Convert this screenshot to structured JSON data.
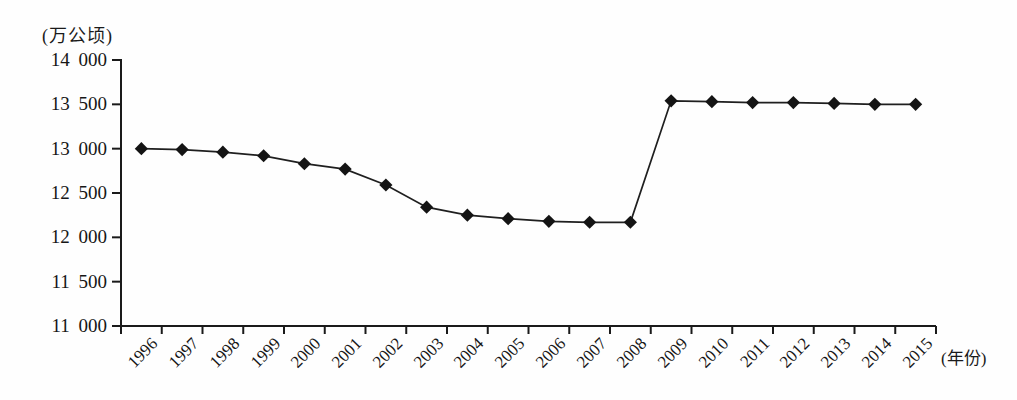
{
  "chart_data": {
    "type": "line",
    "title": "",
    "ylabel": "(万公顷)",
    "xlabel": "(年份)",
    "legend": "none",
    "grid": false,
    "marker": "diamond",
    "line_color": "#1f1f1f",
    "marker_color": "#141414",
    "axis_color": "#1a1a1a",
    "ylim": [
      11000,
      14000
    ],
    "yticks": [
      11000,
      11500,
      12000,
      12500,
      13000,
      13500,
      14000
    ],
    "ytick_labels": [
      "11 000",
      "11 500",
      "12 000",
      "12 500",
      "13 000",
      "13 500",
      "14 000"
    ],
    "categories": [
      "1996",
      "1997",
      "1998",
      "1999",
      "2000",
      "2001",
      "2002",
      "2003",
      "2004",
      "2005",
      "2006",
      "2007",
      "2008",
      "2009",
      "2010",
      "2011",
      "2012",
      "2013",
      "2014",
      "2015"
    ],
    "series": [
      {
        "name": "",
        "values": [
          13000,
          12990,
          12960,
          12920,
          12830,
          12770,
          12590,
          12340,
          12250,
          12210,
          12180,
          12170,
          12170,
          13540,
          13530,
          13520,
          13520,
          13510,
          13500,
          13500
        ]
      }
    ]
  }
}
